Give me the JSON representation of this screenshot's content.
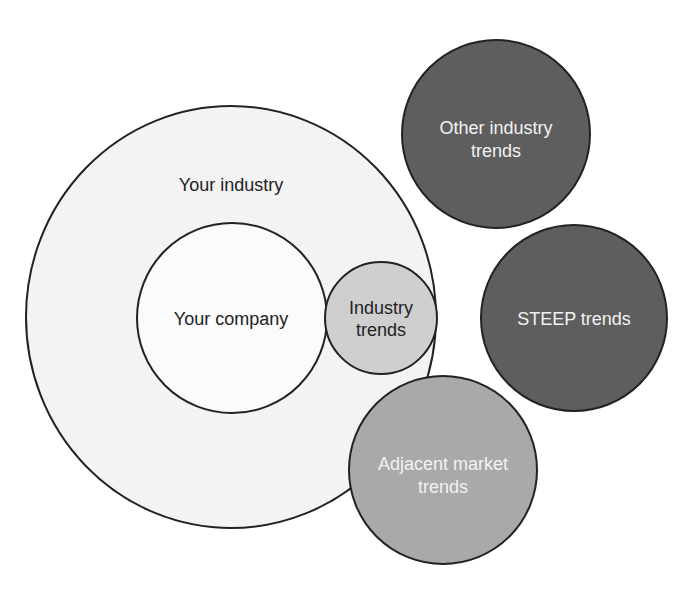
{
  "diagram": {
    "colors": {
      "industry_fill": "#f3f3f3",
      "company_fill": "#fbfbfb",
      "industry_trends_fill": "#cfcfcf",
      "adjacent_fill": "#a9a9a9",
      "other_fill": "#5e5e5e",
      "steep_fill": "#5e5e5e",
      "stroke": "#222222"
    },
    "nodes": {
      "your_industry": {
        "label": "Your industry"
      },
      "your_company": {
        "label": "Your company"
      },
      "industry_trends": {
        "line1": "Industry",
        "line2": "trends"
      },
      "other_industry_trends": {
        "line1": "Other industry",
        "line2": "trends"
      },
      "steep_trends": {
        "label": "STEEP trends"
      },
      "adjacent_market_trends": {
        "line1": "Adjacent market",
        "line2": "trends"
      }
    }
  }
}
